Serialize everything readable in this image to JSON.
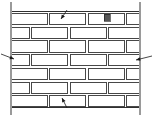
{
  "figure": {
    "type": "line-drawing",
    "width": 153,
    "height": 117,
    "background_color": "#ffffff",
    "line_color": "#1a1a1a",
    "shadow_color": "#9a9a9a",
    "mortar_fill": "#ffffff",
    "accent_block_color": "#555555"
  },
  "wall": {
    "left_edge_x": 11,
    "right_edge_x": 140,
    "top_y": 11,
    "bottom_y": 107,
    "course_count": 7,
    "course_height": 13.7,
    "brick_length": 36,
    "head_joint_width": 2.5,
    "bed_joint_width": 2.5,
    "bond_pattern": "running-bond-half-lap",
    "courses": [
      {
        "index": 0,
        "y": 11,
        "offset": 0,
        "label": "course-1"
      },
      {
        "index": 1,
        "y": 24.7,
        "offset": 18,
        "label": "course-2"
      },
      {
        "index": 2,
        "y": 38.4,
        "offset": 0,
        "label": "course-3"
      },
      {
        "index": 3,
        "y": 52.1,
        "offset": 18,
        "label": "course-4"
      },
      {
        "index": 4,
        "y": 65.8,
        "offset": 0,
        "label": "course-5"
      },
      {
        "index": 5,
        "y": 79.5,
        "offset": 18,
        "label": "course-6"
      },
      {
        "index": 6,
        "y": 93.2,
        "offset": 0,
        "label": "course-7"
      }
    ]
  },
  "accent_block": {
    "x": 104,
    "y": 14,
    "width": 6,
    "height": 7,
    "color": "#555555"
  },
  "leaders": [
    {
      "name": "leader-top",
      "tail_x": 67,
      "tail_y": 10,
      "tip_x": 61,
      "tip_y": 19,
      "direction": "down-left",
      "label": ""
    },
    {
      "name": "leader-left",
      "tail_x": 1,
      "tail_y": 54,
      "tip_x": 14,
      "tip_y": 59,
      "direction": "right",
      "label": ""
    },
    {
      "name": "leader-right",
      "tail_x": 152,
      "tail_y": 56,
      "tip_x": 136,
      "tip_y": 60,
      "direction": "left",
      "label": ""
    },
    {
      "name": "leader-bottom",
      "tail_x": 67,
      "tail_y": 108,
      "tip_x": 62,
      "tip_y": 98,
      "direction": "up-left",
      "label": ""
    }
  ]
}
